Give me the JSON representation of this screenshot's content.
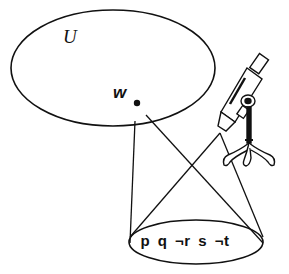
{
  "diagram": {
    "universe_label": "U",
    "world_label": "w",
    "world_point": {
      "x": 137,
      "y": 103
    },
    "valuation_label": "p q ¬r s ¬t",
    "instrument_icon": "microscope",
    "colors": {
      "stroke": "#111111",
      "background": "#ffffff"
    }
  }
}
